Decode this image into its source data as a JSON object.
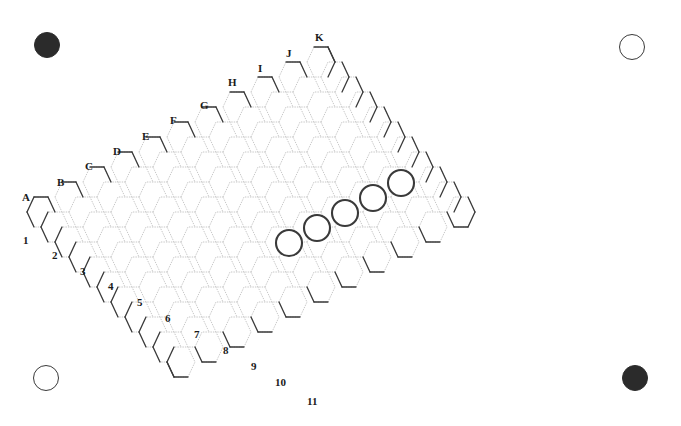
{
  "figure": {
    "board_type": "hex",
    "size": 11,
    "width": 681,
    "height": 426,
    "background_color": "#ffffff"
  },
  "board": {
    "columns": [
      "A",
      "B",
      "C",
      "D",
      "E",
      "F",
      "G",
      "H",
      "I",
      "J",
      "K"
    ],
    "rows": [
      "1",
      "2",
      "3",
      "4",
      "5",
      "6",
      "7",
      "8",
      "9",
      "10",
      "11"
    ],
    "geometry": {
      "hex_width": 28.0,
      "hex_height": 30.0,
      "col_dx": 28.0,
      "col_dy": -15.0,
      "row_dx": 14.0,
      "row_dy": 15.0,
      "origin_x": 41.0,
      "origin_y": 212.0
    },
    "colors": {
      "border_stroke": "#3a3a3a",
      "interior_stroke": "#b9b9b9",
      "dark_stone": "#2b2b2b",
      "light_stone": "#ffffff",
      "stone_outline": "#3a3a3a",
      "label_color": "#1a1a1a"
    },
    "border_stroke_width": 1.3,
    "interior_stroke_width": 0.8
  },
  "column_labels": [
    {
      "label": "A",
      "x": 22,
      "y": 192
    },
    {
      "label": "B",
      "x": 57,
      "y": 177
    },
    {
      "label": "C",
      "x": 85,
      "y": 161
    },
    {
      "label": "D",
      "x": 113,
      "y": 146
    },
    {
      "label": "E",
      "x": 142,
      "y": 131
    },
    {
      "label": "F",
      "x": 170,
      "y": 115
    },
    {
      "label": "G",
      "x": 200,
      "y": 100
    },
    {
      "label": "H",
      "x": 228,
      "y": 77
    },
    {
      "label": "I",
      "x": 258,
      "y": 63
    },
    {
      "label": "J",
      "x": 286,
      "y": 48
    },
    {
      "label": "K",
      "x": 315,
      "y": 32
    }
  ],
  "row_labels": [
    {
      "label": "1",
      "x": 23,
      "y": 235
    },
    {
      "label": "2",
      "x": 52,
      "y": 250
    },
    {
      "label": "3",
      "x": 80,
      "y": 266
    },
    {
      "label": "4",
      "x": 108,
      "y": 281
    },
    {
      "label": "5",
      "x": 137,
      "y": 297
    },
    {
      "label": "6",
      "x": 165,
      "y": 313
    },
    {
      "label": "7",
      "x": 194,
      "y": 329
    },
    {
      "label": "8",
      "x": 223,
      "y": 345
    },
    {
      "label": "9",
      "x": 251,
      "y": 361
    },
    {
      "label": "10",
      "x": 275,
      "y": 377
    },
    {
      "label": "11",
      "x": 307,
      "y": 396
    }
  ],
  "stones": [
    {
      "id": "stone-1",
      "color": "light",
      "cx": 289,
      "cy": 243,
      "r": 13
    },
    {
      "id": "stone-2",
      "color": "light",
      "cx": 317,
      "cy": 228,
      "r": 13
    },
    {
      "id": "stone-3",
      "color": "light",
      "cx": 345,
      "cy": 213,
      "r": 13
    },
    {
      "id": "stone-4",
      "color": "light",
      "cx": 373,
      "cy": 198,
      "r": 13
    },
    {
      "id": "stone-5",
      "color": "light",
      "cx": 401,
      "cy": 183,
      "r": 13
    }
  ],
  "corner_markers": [
    {
      "id": "marker-top-left",
      "position": "top-left",
      "color": "dark",
      "cx": 47,
      "cy": 45,
      "r": 13
    },
    {
      "id": "marker-top-right",
      "position": "top-right",
      "color": "light",
      "cx": 632,
      "cy": 47,
      "r": 13
    },
    {
      "id": "marker-bottom-left",
      "position": "bottom-left",
      "color": "light",
      "cx": 46,
      "cy": 378,
      "r": 13
    },
    {
      "id": "marker-bottom-right",
      "position": "bottom-right",
      "color": "dark",
      "cx": 635,
      "cy": 378,
      "r": 13
    }
  ]
}
